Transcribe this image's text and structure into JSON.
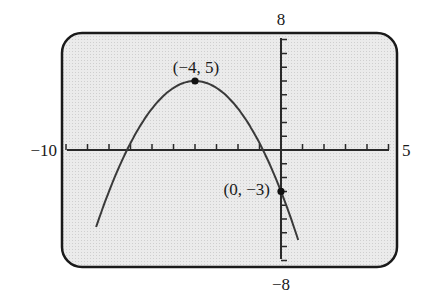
{
  "chart_data": {
    "type": "line",
    "title": "",
    "xlabel": "",
    "ylabel": "",
    "function": "y = -0.5(x + 4)^2 + 5",
    "xlim": [
      -10,
      5
    ],
    "ylim": [
      -8,
      8
    ],
    "x_tick_step": 1,
    "y_tick_step": 1,
    "grid": false,
    "window_labels": {
      "xmin": "−10",
      "xmax": "5",
      "ymin": "−8",
      "ymax": "8"
    },
    "series": [
      {
        "name": "parabola",
        "x": [
          -8.6,
          -8,
          -7,
          -6,
          -5,
          -4,
          -3,
          -2,
          -1,
          0,
          0.8
        ],
        "y": [
          -5.58,
          -3,
          0.5,
          3,
          4.5,
          5,
          4.5,
          3,
          0.5,
          -3,
          -6.52
        ]
      }
    ],
    "annotations": [
      {
        "label": "(−4, 5)",
        "x": -4,
        "y": 5,
        "marker": "point"
      },
      {
        "label": "(0, −3)",
        "x": 0,
        "y": -3,
        "marker": "point"
      }
    ],
    "colors": {
      "screen_bg": "#e6e6e6",
      "frame": "#1a1a1a",
      "curve": "#3a3a3a",
      "axes": "#2a2a2a"
    }
  }
}
